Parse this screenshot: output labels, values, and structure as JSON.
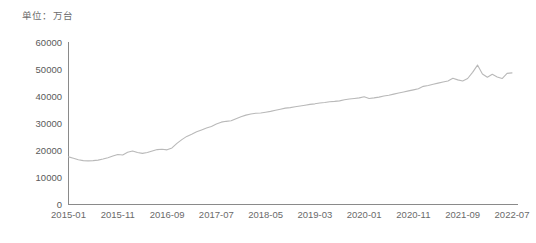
{
  "unit_note": "单位：万台",
  "chart_data": {
    "type": "line",
    "title": "",
    "subtitle": "",
    "xlabel": "",
    "ylabel": "",
    "unit": "万台",
    "grid": false,
    "legend": "none",
    "ylim": [
      0,
      60000
    ],
    "ytick_labels": [
      "60000",
      "50000",
      "40000",
      "30000",
      "20000",
      "10000",
      "0"
    ],
    "ytick_values": [
      60000,
      50000,
      40000,
      30000,
      20000,
      10000,
      0
    ],
    "xtick_labels": [
      "2015-01",
      "2015-11",
      "2016-09",
      "2017-07",
      "2018-05",
      "2019-03",
      "2020-01",
      "2020-11",
      "2021-09",
      "2022-07"
    ],
    "series": [
      {
        "name": "移动电话用户数",
        "color": "#b9b9b9",
        "x": [
          "2015-01",
          "2015-02",
          "2015-03",
          "2015-04",
          "2015-05",
          "2015-06",
          "2015-07",
          "2015-08",
          "2015-09",
          "2015-10",
          "2015-11",
          "2015-12",
          "2016-01",
          "2016-02",
          "2016-03",
          "2016-04",
          "2016-05",
          "2016-06",
          "2016-07",
          "2016-08",
          "2016-09",
          "2016-10",
          "2016-11",
          "2016-12",
          "2017-01",
          "2017-02",
          "2017-03",
          "2017-04",
          "2017-05",
          "2017-06",
          "2017-07",
          "2017-08",
          "2017-09",
          "2017-10",
          "2017-11",
          "2017-12",
          "2018-01",
          "2018-02",
          "2018-03",
          "2018-04",
          "2018-05",
          "2018-06",
          "2018-07",
          "2018-08",
          "2018-09",
          "2018-10",
          "2018-11",
          "2018-12",
          "2019-01",
          "2019-02",
          "2019-03",
          "2019-04",
          "2019-05",
          "2019-06",
          "2019-07",
          "2019-08",
          "2019-09",
          "2019-10",
          "2019-11",
          "2019-12",
          "2020-01",
          "2020-02",
          "2020-03",
          "2020-04",
          "2020-05",
          "2020-06",
          "2020-07",
          "2020-08",
          "2020-09",
          "2020-10",
          "2020-11",
          "2020-12",
          "2021-01",
          "2021-02",
          "2021-03",
          "2021-04",
          "2021-05",
          "2021-06",
          "2021-07",
          "2021-08",
          "2021-09",
          "2021-10",
          "2021-11",
          "2021-12",
          "2022-01",
          "2022-02",
          "2022-03",
          "2022-04",
          "2022-05",
          "2022-06",
          "2022-07"
        ],
        "values": [
          17700,
          17200,
          16600,
          16300,
          16200,
          16300,
          16500,
          16900,
          17400,
          18000,
          18600,
          18400,
          19400,
          19900,
          19300,
          19000,
          19300,
          19900,
          20400,
          20500,
          20300,
          21000,
          22700,
          24100,
          25300,
          26100,
          27000,
          27700,
          28400,
          29000,
          29900,
          30600,
          30900,
          31100,
          31900,
          32600,
          33200,
          33600,
          33900,
          34000,
          34300,
          34600,
          35000,
          35400,
          35800,
          36000,
          36300,
          36600,
          36900,
          37200,
          37400,
          37700,
          37900,
          38200,
          38300,
          38500,
          38900,
          39200,
          39400,
          39600,
          40000,
          39400,
          39600,
          39900,
          40300,
          40600,
          41000,
          41400,
          41800,
          42200,
          42600,
          43000,
          43900,
          44200,
          44700,
          45100,
          45500,
          45900,
          46900,
          46300,
          45900,
          46800,
          49100,
          51800,
          48500,
          47300,
          48400,
          47400,
          46800,
          48700,
          48900
        ]
      }
    ]
  }
}
